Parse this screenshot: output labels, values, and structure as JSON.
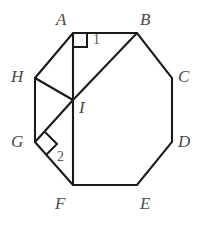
{
  "figure": {
    "kind": "geometry-diagram",
    "background_color": "#ffffff",
    "stroke_color": "#1a1a1a",
    "label_color": "#4a4a4a",
    "angle_label_color": "#585858",
    "stroke_width": 2.1,
    "canvas": {
      "width": 217,
      "height": 228
    }
  },
  "vertices": [
    {
      "name": "A",
      "x": 73,
      "y": 33,
      "label": "A",
      "label_x": 56,
      "label_y": 11
    },
    {
      "name": "B",
      "x": 137,
      "y": 33,
      "label": "B",
      "label_x": 140,
      "label_y": 11
    },
    {
      "name": "C",
      "x": 172,
      "y": 78,
      "label": "C",
      "label_x": 178,
      "label_y": 68
    },
    {
      "name": "D",
      "x": 172,
      "y": 142,
      "label": "D",
      "label_x": 178,
      "label_y": 133
    },
    {
      "name": "E",
      "x": 137,
      "y": 185,
      "label": "E",
      "label_x": 140,
      "label_y": 195
    },
    {
      "name": "F",
      "x": 73,
      "y": 185,
      "label": "F",
      "label_x": 55,
      "label_y": 195
    },
    {
      "name": "G",
      "x": 35,
      "y": 142,
      "label": "G",
      "label_x": 11,
      "label_y": 133
    },
    {
      "name": "H",
      "x": 35,
      "y": 78,
      "label": "H",
      "label_x": 11,
      "label_y": 68
    }
  ],
  "interior_points": [
    {
      "name": "I",
      "x": 73,
      "y": 100,
      "label": "I",
      "label_x": 79,
      "label_y": 100
    }
  ],
  "octagon_path": "M 73,33 L 137,33 L 172,78 L 172,142 L 137,185 L 73,185 L 35,142 L 35,78 Z",
  "segments": [
    {
      "name": "AF",
      "from": "A",
      "to": "F",
      "d": "M 73,33 L 73,185"
    },
    {
      "name": "IB",
      "from": "I",
      "to": "B",
      "d": "M 73,100 L 137,33"
    },
    {
      "name": "HI",
      "from": "H",
      "to": "I",
      "d": "M 35,78 L 73,100"
    },
    {
      "name": "IG",
      "from": "I",
      "to": "G",
      "d": "M 73,100 L 35,142"
    }
  ],
  "right_angle_marks": [
    {
      "name": "right-angle-at-A",
      "d": "M 73,47 L 87,47 L 87,33"
    },
    {
      "name": "right-angle-at-G",
      "d": "M 45,132 L 57,144 L 46,155"
    }
  ],
  "angle_labels": [
    {
      "name": "angle-1",
      "text": "1",
      "x": 96,
      "y": 36
    },
    {
      "name": "angle-2",
      "text": "2",
      "x": 58,
      "y": 155
    }
  ]
}
